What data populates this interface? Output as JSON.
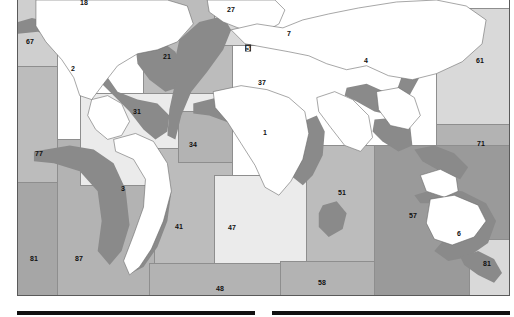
{
  "figure": {
    "type": "world-map",
    "colors": {
      "land": "#ffffff",
      "country_border": "#6b6b6b",
      "shelf": "#8a8a8a",
      "region_border": "#8e8e8e",
      "label_text": "#101010",
      "footer_rule": "#111111",
      "zone_light": "#d9d9d9",
      "zone_mid": "#bcbcbc",
      "zone_dark": "#a6a6a6"
    }
  },
  "regions": [
    {
      "id": "r18",
      "label": "18",
      "x": 83,
      "y": 2,
      "note": "clipped at top edge",
      "boxed": false
    },
    {
      "id": "r67",
      "label": "67",
      "x": 29,
      "y": 41,
      "boxed": false
    },
    {
      "id": "r2",
      "label": "2",
      "x": 72,
      "y": 68,
      "boxed": false
    },
    {
      "id": "r21",
      "label": "21",
      "x": 166,
      "y": 56,
      "boxed": false
    },
    {
      "id": "r27",
      "label": "27",
      "x": 230,
      "y": 9,
      "boxed": false
    },
    {
      "id": "r5",
      "label": "5",
      "x": 247,
      "y": 48,
      "boxed": true
    },
    {
      "id": "r7",
      "label": "7",
      "x": 288,
      "y": 33,
      "boxed": false
    },
    {
      "id": "r4",
      "label": "4",
      "x": 365,
      "y": 60,
      "boxed": false
    },
    {
      "id": "r61",
      "label": "61",
      "x": 479,
      "y": 60,
      "boxed": false
    },
    {
      "id": "r37",
      "label": "37",
      "x": 261,
      "y": 82,
      "boxed": false
    },
    {
      "id": "r31",
      "label": "31",
      "x": 136,
      "y": 111,
      "boxed": false
    },
    {
      "id": "r1",
      "label": "1",
      "x": 364,
      "y": 75,
      "boxed": false
    },
    {
      "id": "r34",
      "label": "34",
      "x": 192,
      "y": 144,
      "boxed": false
    },
    {
      "id": "r71",
      "label": "71",
      "x": 480,
      "y": 143,
      "boxed": false
    },
    {
      "id": "r77",
      "label": "77",
      "x": 38,
      "y": 153,
      "boxed": false
    },
    {
      "id": "r3",
      "label": "3",
      "x": 122,
      "y": 188,
      "boxed": false
    },
    {
      "id": "r51",
      "label": "51",
      "x": 341,
      "y": 192,
      "boxed": false
    },
    {
      "id": "r41",
      "label": "41",
      "x": 178,
      "y": 226,
      "boxed": false
    },
    {
      "id": "r47",
      "label": "47",
      "x": 231,
      "y": 227,
      "boxed": false
    },
    {
      "id": "r57",
      "label": "57",
      "x": 412,
      "y": 215,
      "boxed": false
    },
    {
      "id": "r6",
      "label": "6",
      "x": 458,
      "y": 233,
      "boxed": false
    },
    {
      "id": "r81e",
      "label": "81",
      "x": 486,
      "y": 263,
      "boxed": false
    },
    {
      "id": "r81w",
      "label": "81",
      "x": 33,
      "y": 258,
      "boxed": false
    },
    {
      "id": "r87",
      "label": "87",
      "x": 78,
      "y": 258,
      "boxed": false
    },
    {
      "id": "r48",
      "label": "48",
      "x": 219,
      "y": 288,
      "boxed": false
    },
    {
      "id": "r58",
      "label": "58",
      "x": 321,
      "y": 282,
      "boxed": false
    }
  ],
  "footer": {
    "rules": [
      {
        "name": "left-figure-rule",
        "x": 17,
        "y": 311,
        "width": 238
      },
      {
        "name": "right-figure-rule",
        "x": 272,
        "y": 311,
        "width": 238
      }
    ]
  }
}
